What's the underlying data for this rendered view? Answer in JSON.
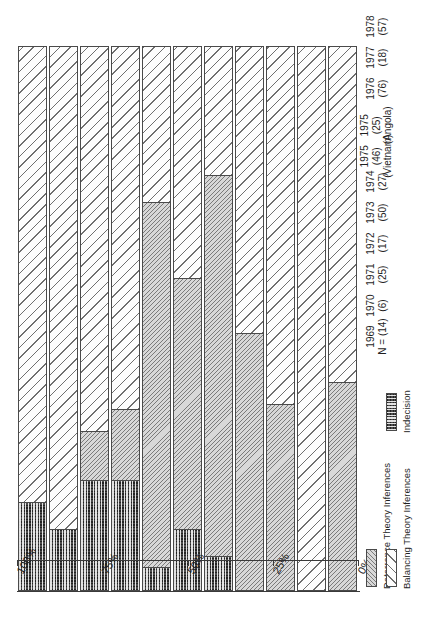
{
  "chart_data": {
    "type": "bar",
    "orientation": "horizontal-rotated",
    "stacked": true,
    "title": "",
    "xlabel": "",
    "ylabel": "",
    "ylim": [
      0,
      100
    ],
    "grid": false,
    "legend_position": "bottom-right",
    "categories": [
      "1969\nN = (14)",
      "1970\n(6)",
      "1971\n(25)",
      "1972\n(17)",
      "1973\n(50)",
      "1974\n(27)",
      "1975\n(46)\n(Vietnam)",
      "1975\n(25)\n(Angola)",
      "1976\n(76)",
      "1977\n(18)",
      "1978\n(57)"
    ],
    "category_years": [
      "1969",
      "1970",
      "1971",
      "1972",
      "1973",
      "1974",
      "1975",
      "1975",
      "1976",
      "1977",
      "1978"
    ],
    "category_counts": [
      "N = (14)",
      "(6)",
      "(25)",
      "(17)",
      "(50)",
      "(27)",
      "(46)",
      "(25)",
      "(76)",
      "(18)",
      "(57)"
    ],
    "category_notes": [
      "",
      "",
      "",
      "",
      "",
      "",
      "(Vietnam)",
      "(Angola)",
      "",
      "",
      ""
    ],
    "series": [
      {
        "name": "Indecision",
        "fill": "indecision",
        "values": [
          0,
          0,
          0,
          0,
          6,
          11,
          4,
          20,
          20,
          11,
          16
        ]
      },
      {
        "name": "Deterrence Theory Inferences",
        "fill": "deterrence",
        "values": [
          38,
          0,
          34,
          47,
          70,
          46,
          67,
          13,
          9,
          0,
          0
        ]
      },
      {
        "name": "Balancing Theory Inferences",
        "fill": "balancing",
        "values": [
          62,
          100,
          66,
          53,
          24,
          43,
          29,
          67,
          71,
          89,
          84
        ]
      }
    ],
    "ticks": [
      {
        "label": "100%",
        "value": 100
      },
      {
        "label": "75%",
        "value": 75
      },
      {
        "label": "50%",
        "value": 50
      },
      {
        "label": "25%",
        "value": 25
      },
      {
        "label": "0%",
        "value": 0
      }
    ],
    "legend": [
      {
        "label": "Deterrence Theory Inferences",
        "fill": "deterrence"
      },
      {
        "label": "Balancing Theory Inferences",
        "fill": "balancing"
      },
      {
        "label": "Indecision",
        "fill": "indecision"
      }
    ],
    "colors": {
      "deterrence": "#d8d8d8",
      "balancing": "#fdfdfd",
      "indecision": "#4d4d4d",
      "outline": "#4a4a4a",
      "axis": "#3a3a3a",
      "background": "#ffffff"
    }
  }
}
